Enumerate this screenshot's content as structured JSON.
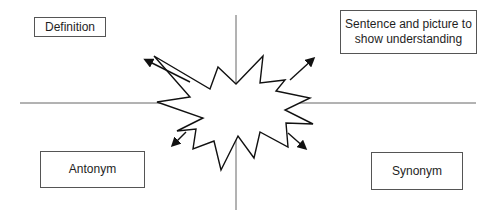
{
  "diagram": {
    "type": "vocabulary-frayer-organizer",
    "colors": {
      "background": "#ffffff",
      "lines": "#555555",
      "starburst": "#111111",
      "box_border": "#555555",
      "text": "#1e1e1e"
    },
    "boxes": {
      "definition": {
        "label": "Definition"
      },
      "sentence": {
        "label": "Sentence and picture to show understanding"
      },
      "antonym": {
        "label": "Antonym"
      },
      "synonym": {
        "label": "Synonym"
      }
    },
    "center_shape": "starburst",
    "arrows": [
      {
        "direction": "up-left",
        "target": "definition"
      },
      {
        "direction": "up-right",
        "target": "sentence"
      },
      {
        "direction": "down-left",
        "target": "antonym"
      },
      {
        "direction": "down-right",
        "target": "synonym"
      }
    ]
  }
}
